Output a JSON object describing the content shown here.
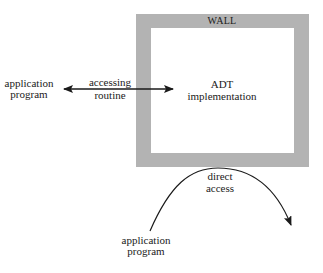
{
  "diagram": {
    "wall": {
      "label": "WALL",
      "color": "#b3b3b3",
      "outer": {
        "x": 136,
        "y": 14,
        "w": 173,
        "h": 153
      },
      "inner": {
        "x": 151,
        "y": 28,
        "w": 143,
        "h": 125
      }
    },
    "adt": {
      "line1": "ADT",
      "line2": "implementation"
    },
    "accessing_routine": {
      "line1": "accessing",
      "line2": "routine"
    },
    "left_program": {
      "line1": "application",
      "line2": "program"
    },
    "bottom_program": {
      "line1": "application",
      "line2": "program"
    },
    "direct_access": {
      "line1": "direct",
      "line2": "access"
    },
    "colors": {
      "ink": "#1a1a1a",
      "background": "#ffffff"
    }
  }
}
